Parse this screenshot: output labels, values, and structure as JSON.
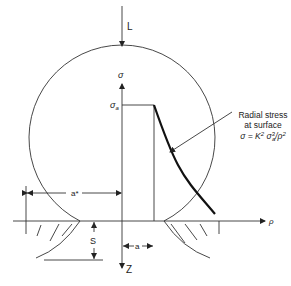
{
  "diagram": {
    "labels": {
      "load": "L",
      "sigma_axis": "σ",
      "sigma_a": "σ",
      "sigma_a_sub": "a",
      "rho_axis": "ρ",
      "z_axis": "Z",
      "a_star": "a*",
      "a": "a",
      "s": "S"
    },
    "annotation": {
      "line1": "Radial stress",
      "line2": "at surface",
      "formula_prefix": "σ = K",
      "formula_sup1": "2",
      "formula_mid": " σ",
      "formula_sup2": "3",
      "formula_sub": "a",
      "formula_tail": "/ρ",
      "formula_sup3": "2"
    },
    "colors": {
      "line": "#333333",
      "curve": "#111111",
      "background": "#ffffff"
    }
  }
}
